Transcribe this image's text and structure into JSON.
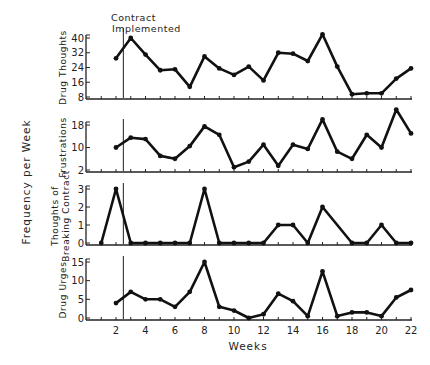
{
  "chart_data": {
    "type": "line",
    "title": "",
    "xlabel": "Weeks",
    "ylabel": "Frequency per Week",
    "x": [
      1,
      2,
      3,
      4,
      5,
      6,
      7,
      8,
      9,
      10,
      11,
      12,
      13,
      14,
      15,
      16,
      17,
      18,
      19,
      20,
      21,
      22
    ],
    "x_tick_labels": [
      "2",
      "4",
      "6",
      "8",
      "10",
      "12",
      "14",
      "16",
      "18",
      "20",
      "22"
    ],
    "x_tick_values": [
      2,
      4,
      6,
      8,
      10,
      12,
      14,
      16,
      18,
      20,
      22
    ],
    "xlim": [
      0,
      22
    ],
    "annotation": {
      "text_line1": "Contract",
      "text_line2": "Implemented",
      "x": 2.5
    },
    "grid": false,
    "panels": [
      {
        "name": "Drug Thoughts",
        "label_lines": [
          "Drug Thoughts"
        ],
        "yticks": [
          8,
          16,
          24,
          32,
          40
        ],
        "ylim": [
          8,
          40
        ],
        "points": [
          [
            2,
            29
          ],
          [
            3,
            40
          ],
          [
            4,
            31
          ],
          [
            5,
            22.5
          ],
          [
            6,
            23
          ],
          [
            7,
            13.5
          ],
          [
            8,
            30
          ],
          [
            9,
            23.5
          ],
          [
            10,
            20
          ],
          [
            11,
            24.5
          ],
          [
            12,
            17
          ],
          [
            13,
            32
          ],
          [
            14,
            31.5
          ],
          [
            15,
            27.5
          ],
          [
            16,
            42
          ],
          [
            17,
            24.5
          ],
          [
            18,
            9.5
          ],
          [
            19,
            10
          ],
          [
            20,
            10
          ],
          [
            21,
            18
          ],
          [
            22,
            23.5
          ]
        ]
      },
      {
        "name": "Frustrations",
        "label_lines": [
          "Frustrations"
        ],
        "yticks": [
          2,
          10,
          18
        ],
        "ylim": [
          2,
          18
        ],
        "points": [
          [
            2,
            10
          ],
          [
            3,
            13.5
          ],
          [
            4,
            13
          ],
          [
            5,
            7
          ],
          [
            6,
            6
          ],
          [
            7,
            10.5
          ],
          [
            8,
            17.5
          ],
          [
            9,
            14.5
          ],
          [
            10,
            3
          ],
          [
            11,
            5
          ],
          [
            12,
            11
          ],
          [
            13,
            3.5
          ],
          [
            14,
            11
          ],
          [
            15,
            9.5
          ],
          [
            16,
            20
          ],
          [
            17,
            8.5
          ],
          [
            18,
            6
          ],
          [
            19,
            14.5
          ],
          [
            20,
            10
          ],
          [
            21,
            23.5
          ],
          [
            22,
            15
          ]
        ]
      },
      {
        "name": "Thoughts of Breaking Contract",
        "label_lines": [
          "Thoughts of",
          "Breaking Contract"
        ],
        "yticks": [
          0,
          1,
          2,
          3
        ],
        "ylim": [
          0,
          3
        ],
        "points": [
          [
            1,
            0
          ],
          [
            2,
            3
          ],
          [
            3,
            0
          ],
          [
            4,
            0
          ],
          [
            5,
            0
          ],
          [
            6,
            0
          ],
          [
            7,
            0
          ],
          [
            8,
            3
          ],
          [
            9,
            0
          ],
          [
            10,
            0
          ],
          [
            11,
            0
          ],
          [
            12,
            0
          ],
          [
            13,
            1
          ],
          [
            14,
            1
          ],
          [
            15,
            0
          ],
          [
            16,
            2
          ],
          [
            18,
            0
          ],
          [
            19,
            0
          ],
          [
            20,
            1
          ],
          [
            21,
            0
          ],
          [
            22,
            0
          ]
        ]
      },
      {
        "name": "Drug Urges",
        "label_lines": [
          "Drug Urges"
        ],
        "yticks": [
          0,
          5,
          10,
          15
        ],
        "ylim": [
          0,
          15
        ],
        "points": [
          [
            2,
            4
          ],
          [
            3,
            7
          ],
          [
            4,
            5
          ],
          [
            5,
            5
          ],
          [
            6,
            3
          ],
          [
            7,
            7
          ],
          [
            8,
            15
          ],
          [
            9,
            3
          ],
          [
            10,
            2
          ],
          [
            11,
            0
          ],
          [
            12,
            1
          ],
          [
            13,
            6.5
          ],
          [
            14,
            4.5
          ],
          [
            15,
            0.5
          ],
          [
            16,
            12.5
          ],
          [
            17,
            0.5
          ],
          [
            18,
            1.5
          ],
          [
            19,
            1.5
          ],
          [
            20,
            0.5
          ],
          [
            21,
            5.5
          ],
          [
            22,
            7.5
          ]
        ]
      }
    ]
  },
  "layout": {
    "x_px_at_week0": 86.5,
    "px_per_week": 14.75,
    "panels_px": [
      {
        "y_top": 38,
        "y_bottom": 97,
        "axis_y": 99
      },
      {
        "y_top": 125,
        "y_bottom": 170,
        "axis_y": 172
      },
      {
        "y_top": 189,
        "y_bottom": 243,
        "axis_y": 245
      },
      {
        "y_top": 262,
        "y_bottom": 318,
        "axis_y": 320
      }
    ],
    "line_color": "#111111",
    "axis_color": "#222222"
  }
}
